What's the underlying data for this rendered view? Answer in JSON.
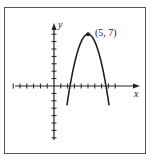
{
  "chart_data": {
    "type": "line",
    "title": "",
    "xlabel": "x",
    "ylabel": "y",
    "xlim": [
      -7,
      10
    ],
    "ylim": [
      -7,
      7
    ],
    "grid": false,
    "series": [
      {
        "name": "parabola",
        "equation": "y = -(x-5)^2 + 7",
        "x": [
          1.9,
          2.5,
          3,
          3.5,
          4,
          4.5,
          5,
          5.5,
          6,
          6.5,
          7,
          7.5,
          8.1
        ],
        "y": [
          -2.6,
          0.75,
          3,
          4.75,
          6,
          6.75,
          7,
          6.75,
          6,
          4.75,
          3,
          0.75,
          -2.6
        ]
      }
    ],
    "annotations": [
      {
        "text": "(5, 7)",
        "x": 5,
        "y": 7
      }
    ]
  },
  "labels": {
    "x_axis": "x",
    "y_axis": "y",
    "vertex": "(5, 7)"
  }
}
